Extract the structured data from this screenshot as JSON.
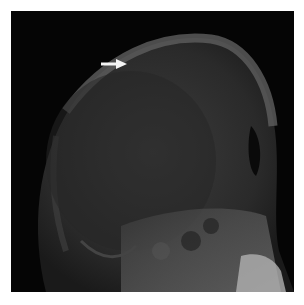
{
  "image": {
    "subject": "lateral skull radiograph",
    "background_color": "#ffffff",
    "film_color": "#050505",
    "bone_color": "#6a6a6a"
  },
  "annotations": [
    {
      "type": "arrow",
      "direction": "right",
      "color": "#f4f4f4",
      "x": 101,
      "y": 64
    }
  ]
}
